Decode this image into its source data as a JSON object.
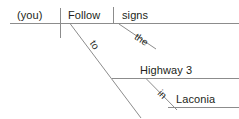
{
  "diagram": {
    "type": "reed-kellogg-sentence-diagram",
    "sentence": "(you) Follow the signs to Highway 3 in Laconia",
    "line_color": "#8c8c8c",
    "text_color": "#231f20",
    "words": {
      "subject": "(you)",
      "verb": "Follow",
      "direct_object": "signs",
      "article": "the",
      "preposition_1": "to",
      "prep_object_1": "Highway 3",
      "preposition_2": "in",
      "prep_object_2": "Laconia"
    },
    "lines": {
      "main_baseline": {
        "x1": 10,
        "y1": 23.5,
        "x2": 239,
        "y2": 23.5
      },
      "subject_verb_divider": {
        "x1": 60.5,
        "y1": 8,
        "x2": 60.5,
        "y2": 38
      },
      "verb_object_divider": {
        "x1": 113.5,
        "y1": 7,
        "x2": 113.5,
        "y2": 23.5
      },
      "article_slant": {
        "x1": 119,
        "y1": 24,
        "x2": 156,
        "y2": 49
      },
      "prep_slant_to": {
        "x1": 70,
        "y1": 23.5,
        "x2": 141,
        "y2": 118
      },
      "prep_baseline_highway": {
        "x1": 112,
        "y1": 78.5,
        "x2": 239,
        "y2": 78.5
      },
      "prep_slant_in": {
        "x1": 146,
        "y1": 78.5,
        "x2": 177,
        "y2": 110
      },
      "prep_baseline_laconia": {
        "x1": 168,
        "y1": 107.5,
        "x2": 239,
        "y2": 107.5
      }
    }
  }
}
